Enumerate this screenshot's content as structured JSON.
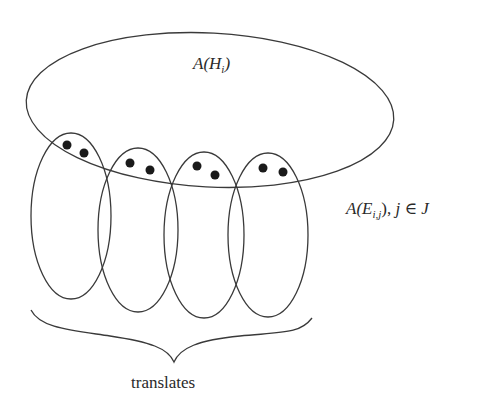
{
  "diagram": {
    "big_set": {
      "label_prefix": "A(H",
      "label_sub": "i",
      "label_suffix": ")",
      "ellipse": {
        "cx": 210,
        "cy": 110,
        "rx": 184,
        "ry": 77,
        "rotate": 3
      }
    },
    "translate_sets": {
      "label_prefix": "A(E",
      "label_sub": "i,j",
      "label_suffix": "), ",
      "label_j": "j",
      "label_in": " ∈ ",
      "label_J": "J",
      "ellipses": [
        {
          "cx": 71,
          "cy": 216,
          "rx": 40,
          "ry": 83
        },
        {
          "cx": 138,
          "cy": 230,
          "rx": 40,
          "ry": 82
        },
        {
          "cx": 204,
          "cy": 235,
          "rx": 40,
          "ry": 83
        },
        {
          "cx": 268,
          "cy": 235,
          "rx": 40,
          "ry": 82
        }
      ],
      "dots": [
        [
          {
            "x": 67,
            "y": 145
          },
          {
            "x": 84,
            "y": 153
          }
        ],
        [
          {
            "x": 130,
            "y": 163
          },
          {
            "x": 150,
            "y": 170
          }
        ],
        [
          {
            "x": 197,
            "y": 166
          },
          {
            "x": 215,
            "y": 175
          }
        ],
        [
          {
            "x": 263,
            "y": 168
          },
          {
            "x": 283,
            "y": 172
          }
        ]
      ]
    },
    "brace": {
      "label": "translates",
      "start": {
        "x": 31,
        "y": 310
      },
      "tip": {
        "x": 174,
        "y": 362
      },
      "end": {
        "x": 312,
        "y": 318
      }
    },
    "colors": {
      "stroke": "#3a3a3a",
      "dot": "#1a1a1a",
      "text": "#2a2a2a",
      "background": "#ffffff"
    }
  }
}
